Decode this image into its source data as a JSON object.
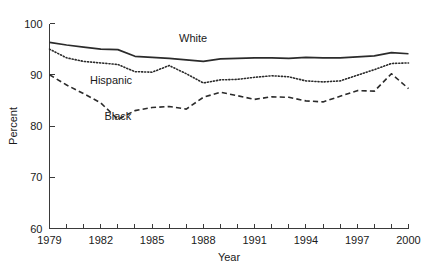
{
  "chart_data": {
    "type": "line",
    "title": "",
    "xlabel": "Year",
    "ylabel": "Percent",
    "xlim": [
      1979,
      2000
    ],
    "ylim": [
      60,
      100
    ],
    "grid": false,
    "legend_position": "inline-annotations",
    "x": [
      1979,
      1980,
      1981,
      1982,
      1983,
      1984,
      1985,
      1986,
      1987,
      1988,
      1989,
      1990,
      1991,
      1992,
      1993,
      1994,
      1995,
      1996,
      1997,
      1998,
      1999,
      2000
    ],
    "xticks": [
      1979,
      1980,
      1981,
      1982,
      1983,
      1984,
      1985,
      1986,
      1987,
      1988,
      1989,
      1990,
      1991,
      1992,
      1993,
      1994,
      1995,
      1996,
      1997,
      1998,
      1999,
      2000
    ],
    "xtick_labels_shown": [
      "1979",
      "1982",
      "1985",
      "1988",
      "1991",
      "1994",
      "1997",
      "2000"
    ],
    "yticks": [
      60,
      70,
      80,
      90,
      100
    ],
    "ytick_labels": [
      "60",
      "70",
      "80",
      "90",
      "100"
    ],
    "series": [
      {
        "name": "White",
        "style": "solid",
        "color": "#2b2b2b",
        "label_x": 1987.4,
        "label_y": 96.3,
        "values": [
          96.3,
          95.8,
          95.4,
          95.0,
          94.9,
          93.6,
          93.4,
          93.2,
          92.9,
          92.6,
          93.1,
          93.2,
          93.3,
          93.3,
          93.2,
          93.4,
          93.3,
          93.3,
          93.5,
          93.7,
          94.3,
          94.1
        ]
      },
      {
        "name": "Hispanic",
        "style": "dotted",
        "color": "#2b2b2b",
        "label_x": 1982.6,
        "label_y": 88.2,
        "values": [
          95.0,
          93.3,
          92.6,
          92.3,
          92.0,
          90.6,
          90.5,
          91.8,
          90.2,
          88.4,
          89.0,
          89.1,
          89.5,
          89.8,
          89.6,
          88.8,
          88.6,
          88.8,
          89.9,
          91.0,
          92.2,
          92.3
        ]
      },
      {
        "name": "Black",
        "style": "dashed",
        "color": "#2b2b2b",
        "label_x": 1983.0,
        "label_y": 81.2,
        "values": [
          90.0,
          88.0,
          86.3,
          84.5,
          81.3,
          83.0,
          83.6,
          83.8,
          83.3,
          85.6,
          86.6,
          85.9,
          85.2,
          85.7,
          85.6,
          84.9,
          84.7,
          85.8,
          86.9,
          86.8,
          90.2,
          87.3
        ]
      }
    ]
  }
}
